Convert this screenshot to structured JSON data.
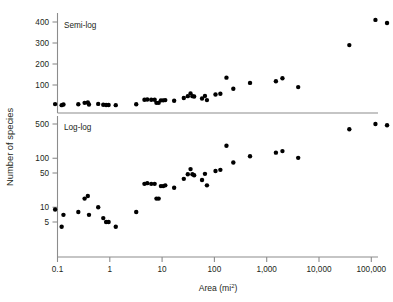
{
  "figure": {
    "y_axis_title": "Number of species",
    "x_axis_title": "Area (mi",
    "x_axis_title_sup": "2",
    "x_axis_title_close": ")"
  },
  "panels": {
    "top": {
      "label": "Semi-log"
    },
    "bottom": {
      "label": "Log-log"
    }
  },
  "x_ticks": [
    {
      "label": "0.1",
      "value": 0.1
    },
    {
      "label": "1",
      "value": 1
    },
    {
      "label": "10",
      "value": 10
    },
    {
      "label": "100",
      "value": 100
    },
    {
      "label": "1,000",
      "value": 1000
    },
    {
      "label": "10,000",
      "value": 10000
    },
    {
      "label": "100,000",
      "value": 100000
    }
  ],
  "y_ticks_top": [
    {
      "label": "400",
      "value": 400
    },
    {
      "label": "300",
      "value": 300
    },
    {
      "label": "200",
      "value": 200
    },
    {
      "label": "100",
      "value": 100
    }
  ],
  "y_ticks_bottom": [
    {
      "label": "500",
      "value": 500
    },
    {
      "label": "100",
      "value": 100
    },
    {
      "label": "50",
      "value": 50
    },
    {
      "label": "10",
      "value": 10
    },
    {
      "label": "5",
      "value": 5
    }
  ],
  "chart_data": [
    {
      "type": "scatter",
      "name": "semi-log",
      "title": "Semi-log",
      "xlabel": "Area (mi2)",
      "ylabel": "Number of species",
      "xscale": "log",
      "yscale": "linear",
      "xlim": [
        0.07,
        300000
      ],
      "ylim": [
        0,
        430
      ],
      "grid": false,
      "legend": false,
      "points": [
        {
          "x": 0.09,
          "y": 9
        },
        {
          "x": 0.12,
          "y": 4
        },
        {
          "x": 0.13,
          "y": 7
        },
        {
          "x": 0.25,
          "y": 8
        },
        {
          "x": 0.33,
          "y": 15
        },
        {
          "x": 0.38,
          "y": 17
        },
        {
          "x": 0.4,
          "y": 7
        },
        {
          "x": 0.6,
          "y": 10
        },
        {
          "x": 0.75,
          "y": 6
        },
        {
          "x": 0.85,
          "y": 5
        },
        {
          "x": 0.95,
          "y": 5
        },
        {
          "x": 1.3,
          "y": 4
        },
        {
          "x": 3.2,
          "y": 8
        },
        {
          "x": 4.6,
          "y": 30
        },
        {
          "x": 5.2,
          "y": 31
        },
        {
          "x": 6.2,
          "y": 30
        },
        {
          "x": 7.2,
          "y": 30
        },
        {
          "x": 7.8,
          "y": 15
        },
        {
          "x": 8.6,
          "y": 15
        },
        {
          "x": 9.5,
          "y": 27
        },
        {
          "x": 10.5,
          "y": 27
        },
        {
          "x": 11.5,
          "y": 28
        },
        {
          "x": 17,
          "y": 25
        },
        {
          "x": 26,
          "y": 38
        },
        {
          "x": 31,
          "y": 47
        },
        {
          "x": 35,
          "y": 60
        },
        {
          "x": 38,
          "y": 47
        },
        {
          "x": 41,
          "y": 45
        },
        {
          "x": 58,
          "y": 36
        },
        {
          "x": 66,
          "y": 48
        },
        {
          "x": 72,
          "y": 28
        },
        {
          "x": 105,
          "y": 55
        },
        {
          "x": 130,
          "y": 58
        },
        {
          "x": 170,
          "y": 135
        },
        {
          "x": 230,
          "y": 82
        },
        {
          "x": 480,
          "y": 110
        },
        {
          "x": 1500,
          "y": 118
        },
        {
          "x": 2000,
          "y": 132
        },
        {
          "x": 4000,
          "y": 90
        },
        {
          "x": 38000,
          "y": 290
        },
        {
          "x": 120000,
          "y": 410
        },
        {
          "x": 200000,
          "y": 395
        }
      ]
    },
    {
      "type": "scatter",
      "name": "log-log",
      "title": "Log-log",
      "xlabel": "Area (mi2)",
      "ylabel": "Number of species",
      "xscale": "log",
      "yscale": "log",
      "xlim": [
        0.07,
        300000
      ],
      "ylim": [
        2.2,
        900
      ],
      "grid": false,
      "legend": false,
      "points": [
        {
          "x": 0.09,
          "y": 9
        },
        {
          "x": 0.12,
          "y": 4
        },
        {
          "x": 0.13,
          "y": 7
        },
        {
          "x": 0.25,
          "y": 8
        },
        {
          "x": 0.33,
          "y": 15
        },
        {
          "x": 0.38,
          "y": 17
        },
        {
          "x": 0.4,
          "y": 7
        },
        {
          "x": 0.6,
          "y": 10
        },
        {
          "x": 0.75,
          "y": 6
        },
        {
          "x": 0.85,
          "y": 5
        },
        {
          "x": 0.95,
          "y": 5
        },
        {
          "x": 1.3,
          "y": 4
        },
        {
          "x": 3.2,
          "y": 8
        },
        {
          "x": 4.6,
          "y": 30
        },
        {
          "x": 5.2,
          "y": 31
        },
        {
          "x": 6.2,
          "y": 30
        },
        {
          "x": 7.2,
          "y": 30
        },
        {
          "x": 7.8,
          "y": 15
        },
        {
          "x": 8.6,
          "y": 15
        },
        {
          "x": 9.5,
          "y": 27
        },
        {
          "x": 10.5,
          "y": 27
        },
        {
          "x": 11.5,
          "y": 28
        },
        {
          "x": 17,
          "y": 25
        },
        {
          "x": 26,
          "y": 38
        },
        {
          "x": 31,
          "y": 47
        },
        {
          "x": 35,
          "y": 60
        },
        {
          "x": 38,
          "y": 47
        },
        {
          "x": 41,
          "y": 45
        },
        {
          "x": 58,
          "y": 36
        },
        {
          "x": 66,
          "y": 48
        },
        {
          "x": 72,
          "y": 28
        },
        {
          "x": 105,
          "y": 55
        },
        {
          "x": 130,
          "y": 58
        },
        {
          "x": 170,
          "y": 180
        },
        {
          "x": 230,
          "y": 82
        },
        {
          "x": 480,
          "y": 110
        },
        {
          "x": 1500,
          "y": 130
        },
        {
          "x": 2000,
          "y": 140
        },
        {
          "x": 4000,
          "y": 102
        },
        {
          "x": 38000,
          "y": 390
        },
        {
          "x": 120000,
          "y": 500
        },
        {
          "x": 200000,
          "y": 470
        }
      ]
    }
  ]
}
